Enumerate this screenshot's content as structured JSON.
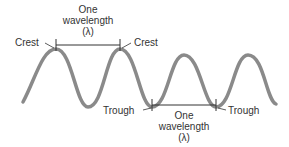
{
  "diagram": {
    "labels": {
      "crest_left": "Crest",
      "crest_right": "Crest",
      "trough_left": "Trough",
      "trough_right": "Trough",
      "top_wavelength_line1": "One",
      "top_wavelength_line2": "wavelength",
      "top_wavelength_line3": "(λ)",
      "bottom_wavelength_line1": "One",
      "bottom_wavelength_line2": "wavelength",
      "bottom_wavelength_line3": "(λ)"
    },
    "colors": {
      "wave": "#8a8a8a",
      "lines": "#333333",
      "text": "#333333"
    }
  }
}
